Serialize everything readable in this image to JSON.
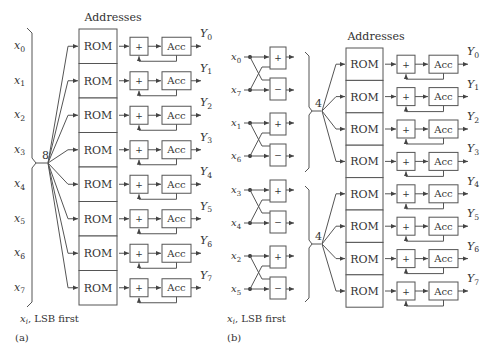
{
  "panel_a": {
    "caption": "(a)",
    "addresses_label": "Addresses",
    "bus_width": "8",
    "input_note_var": "x",
    "input_note_sub": "i",
    "input_note_text": ", LSB first",
    "inputs": [
      {
        "var": "x",
        "sub": "0"
      },
      {
        "var": "x",
        "sub": "1"
      },
      {
        "var": "x",
        "sub": "2"
      },
      {
        "var": "x",
        "sub": "3"
      },
      {
        "var": "x",
        "sub": "4"
      },
      {
        "var": "x",
        "sub": "5"
      },
      {
        "var": "x",
        "sub": "6"
      },
      {
        "var": "x",
        "sub": "7"
      }
    ],
    "rows": [
      {
        "rom": "ROM",
        "adder": "+",
        "acc": "Acc",
        "out_var": "Y",
        "out_sub": "0"
      },
      {
        "rom": "ROM",
        "adder": "+",
        "acc": "Acc",
        "out_var": "Y",
        "out_sub": "1"
      },
      {
        "rom": "ROM",
        "adder": "+",
        "acc": "Acc",
        "out_var": "Y",
        "out_sub": "2"
      },
      {
        "rom": "ROM",
        "adder": "+",
        "acc": "Acc",
        "out_var": "Y",
        "out_sub": "3"
      },
      {
        "rom": "ROM",
        "adder": "+",
        "acc": "Acc",
        "out_var": "Y",
        "out_sub": "4"
      },
      {
        "rom": "ROM",
        "adder": "+",
        "acc": "Acc",
        "out_var": "Y",
        "out_sub": "5"
      },
      {
        "rom": "ROM",
        "adder": "+",
        "acc": "Acc",
        "out_var": "Y",
        "out_sub": "6"
      },
      {
        "rom": "ROM",
        "adder": "+",
        "acc": "Acc",
        "out_var": "Y",
        "out_sub": "7"
      }
    ]
  },
  "panel_b": {
    "caption": "(b)",
    "addresses_label": "Addresses",
    "bus_width_top": "4",
    "bus_width_bottom": "4",
    "input_note_var": "x",
    "input_note_sub": "i",
    "input_note_text": ", LSB first",
    "butterflies": [
      {
        "top": {
          "var": "x",
          "sub": "0"
        },
        "bottom": {
          "var": "x",
          "sub": "7"
        },
        "op_top": "+",
        "op_bottom": "−"
      },
      {
        "top": {
          "var": "x",
          "sub": "1"
        },
        "bottom": {
          "var": "x",
          "sub": "6"
        },
        "op_top": "+",
        "op_bottom": "−"
      },
      {
        "top": {
          "var": "x",
          "sub": "3"
        },
        "bottom": {
          "var": "x",
          "sub": "4"
        },
        "op_top": "+",
        "op_bottom": "−"
      },
      {
        "top": {
          "var": "x",
          "sub": "2"
        },
        "bottom": {
          "var": "x",
          "sub": "5"
        },
        "op_top": "+",
        "op_bottom": "−"
      }
    ],
    "rows": [
      {
        "rom": "ROM",
        "adder": "+",
        "acc": "Acc",
        "out_var": "Y",
        "out_sub": "0"
      },
      {
        "rom": "ROM",
        "adder": "+",
        "acc": "Acc",
        "out_var": "Y",
        "out_sub": "1"
      },
      {
        "rom": "ROM",
        "adder": "+",
        "acc": "Acc",
        "out_var": "Y",
        "out_sub": "2"
      },
      {
        "rom": "ROM",
        "adder": "+",
        "acc": "Acc",
        "out_var": "Y",
        "out_sub": "3"
      },
      {
        "rom": "ROM",
        "adder": "+",
        "acc": "Acc",
        "out_var": "Y",
        "out_sub": "4"
      },
      {
        "rom": "ROM",
        "adder": "+",
        "acc": "Acc",
        "out_var": "Y",
        "out_sub": "5"
      },
      {
        "rom": "ROM",
        "adder": "+",
        "acc": "Acc",
        "out_var": "Y",
        "out_sub": "6"
      },
      {
        "rom": "ROM",
        "adder": "+",
        "acc": "Acc",
        "out_var": "Y",
        "out_sub": "7"
      }
    ]
  },
  "colors": {
    "line": "#555555",
    "text": "#333333",
    "background": "#ffffff"
  }
}
